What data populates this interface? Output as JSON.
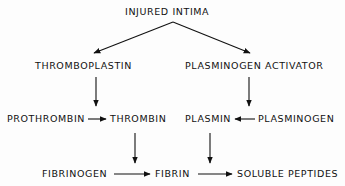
{
  "diagram": {
    "nodes": {
      "injured_intima": "INJURED INTIMA",
      "thromboplastin": "THROMBOPLASTIN",
      "plasminogen_activator": "PLASMINOGEN ACTIVATOR",
      "prothrombin": "PROTHROMBIN",
      "thrombin": "THROMBIN",
      "plasmin": "PLASMIN",
      "plasminogen": "PLASMINOGEN",
      "fibrinogen": "FIBRINOGEN",
      "fibrin": "FIBRIN",
      "soluble_peptides": "SOLUBLE PEPTIDES"
    },
    "edges": [
      {
        "from": "INJURED INTIMA",
        "to": "THROMBOPLASTIN"
      },
      {
        "from": "INJURED INTIMA",
        "to": "PLASMINOGEN ACTIVATOR"
      },
      {
        "from": "THROMBOPLASTIN",
        "to": "PROTHROMBIN→THROMBIN"
      },
      {
        "from": "PLASMINOGEN ACTIVATOR",
        "to": "PLASMINOGEN→PLASMIN"
      },
      {
        "from": "PROTHROMBIN",
        "to": "THROMBIN"
      },
      {
        "from": "PLASMINOGEN",
        "to": "PLASMIN"
      },
      {
        "from": "THROMBIN",
        "to": "FIBRINOGEN→FIBRIN"
      },
      {
        "from": "PLASMIN",
        "to": "FIBRIN→SOLUBLE PEPTIDES"
      },
      {
        "from": "FIBRINOGEN",
        "to": "FIBRIN"
      },
      {
        "from": "FIBRIN",
        "to": "SOLUBLE PEPTIDES"
      }
    ]
  }
}
